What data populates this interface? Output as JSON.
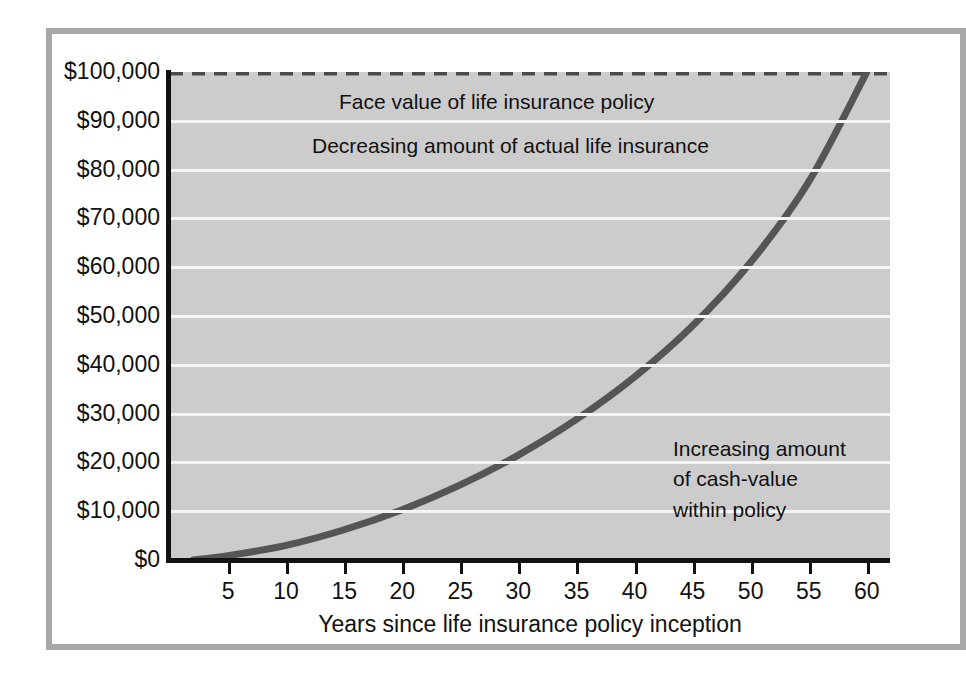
{
  "chart_data": {
    "type": "line",
    "title": "",
    "xlabel": "Years since life insurance policy inception",
    "ylabel": "",
    "xlim": [
      0,
      62
    ],
    "ylim": [
      0,
      100000
    ],
    "grid": true,
    "legend": "none",
    "x_ticks": [
      5,
      10,
      15,
      20,
      25,
      30,
      35,
      40,
      45,
      50,
      55,
      60
    ],
    "x_tick_labels": [
      "5",
      "10",
      "15",
      "20",
      "25",
      "30",
      "35",
      "40",
      "45",
      "50",
      "55",
      "60"
    ],
    "y_ticks": [
      0,
      10000,
      20000,
      30000,
      40000,
      50000,
      60000,
      70000,
      80000,
      90000,
      100000
    ],
    "y_tick_labels": [
      "$0",
      "$10,000",
      "$20,000",
      "$30,000",
      "$40,000",
      "$50,000",
      "$60,000",
      "$70,000",
      "$80,000",
      "$90,000",
      "$100,000"
    ],
    "series": [
      {
        "name": "Face value of life insurance policy",
        "style": "dashed",
        "color": "#4a4a4a",
        "x": [
          0,
          62
        ],
        "values": [
          100000,
          100000
        ]
      },
      {
        "name": "Increasing amount of cash-value within policy",
        "style": "solid",
        "color": "#555555",
        "x": [
          2,
          5,
          10,
          15,
          20,
          25,
          30,
          35,
          40,
          45,
          50,
          55,
          60
        ],
        "values": [
          0,
          900,
          3000,
          6200,
          10300,
          15400,
          21500,
          28800,
          37500,
          48000,
          61000,
          77500,
          100000
        ]
      }
    ],
    "annotations": [
      {
        "id": "face-value",
        "text": "Face value of life insurance policy",
        "x": 17,
        "y": 96500
      },
      {
        "id": "decreasing",
        "text": "Decreasing amount of actual life insurance",
        "x": 15,
        "y": 87500
      },
      {
        "id": "increasing",
        "text": "Increasing amount\nof cash-value\nwithin policy",
        "x": 45,
        "y": 25000
      }
    ]
  },
  "colors": {
    "plot_background": "#cccccc",
    "gridline": "#f4f4f4",
    "axis": "#111111",
    "curve": "#555555",
    "dashed_line": "#4a4a4a",
    "frame_border": "#a8a8a8",
    "page_background": "#ffffff"
  }
}
